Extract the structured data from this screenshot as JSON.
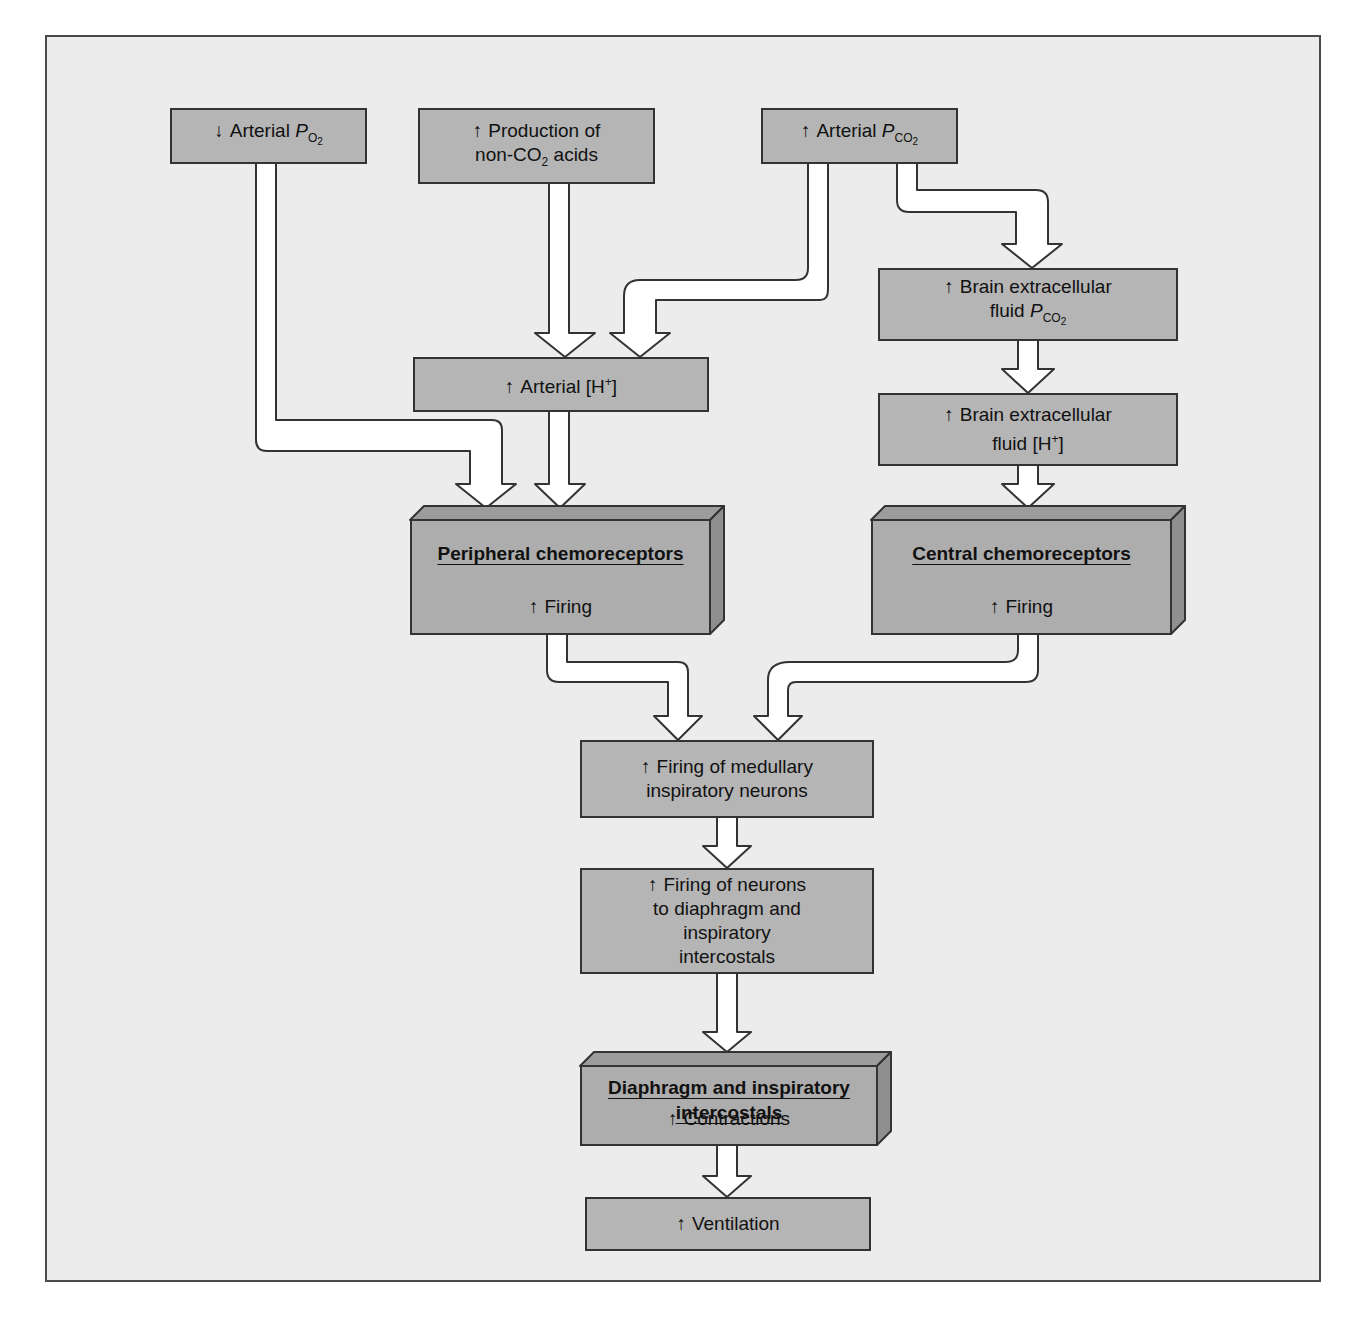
{
  "diagram": {
    "type": "flowchart",
    "colors": {
      "background": "#ffffff",
      "panel": "#ececec",
      "box_fill": "#b5b5b5",
      "box_side": "#8f8f8f",
      "box_top": "#9c9c9c",
      "border": "#333333",
      "arrow_fill": "#ffffff"
    },
    "icons": {
      "increase": "↑",
      "decrease": "↓"
    },
    "nodes": {
      "arterial_po2": {
        "direction": "↓",
        "label": "Arterial ",
        "var": "P",
        "var_sub": "O",
        "var_sub2": "2"
      },
      "non_co2_acids": {
        "direction": "↑",
        "line1": "Production of",
        "line2_pre": "non-CO",
        "line2_sub": "2",
        "line2_post": " acids"
      },
      "arterial_pco2": {
        "direction": "↑",
        "label": "Arterial ",
        "var": "P",
        "var_sub": "CO",
        "var_sub2": "2"
      },
      "brain_pco2": {
        "direction": "↑",
        "line1": "Brain extracellular",
        "line2": "fluid ",
        "var": "P",
        "var_sub": "CO",
        "var_sub2": "2"
      },
      "brain_h": {
        "direction": "↑",
        "line1": "Brain extracellular",
        "line2_pre": "fluid [H",
        "line2_sup": "+",
        "line2_post": "]"
      },
      "arterial_h": {
        "direction": "↑",
        "label_pre": "Arterial [H",
        "label_sup": "+",
        "label_post": "]"
      },
      "peripheral": {
        "title": "Peripheral chemoreceptors",
        "direction": "↑",
        "effect": "Firing"
      },
      "central": {
        "title": "Central chemoreceptors",
        "direction": "↑",
        "effect": "Firing"
      },
      "medullary": {
        "direction": "↑",
        "line1": "Firing of medullary",
        "line2": "inspiratory neurons"
      },
      "neurons_diaphragm": {
        "direction": "↑",
        "line1": "Firing of neurons",
        "line2": "to diaphragm and",
        "line3": "inspiratory",
        "line4": "intercostals"
      },
      "diaphragm": {
        "title_line1": "Diaphragm and inspiratory",
        "title_line2": "intercostals",
        "direction": "↑",
        "effect": "Contractions"
      },
      "ventilation": {
        "direction": "↑",
        "label": "Ventilation"
      }
    },
    "edges": [
      {
        "from": "arterial_po2",
        "to": "peripheral"
      },
      {
        "from": "non_co2_acids",
        "to": "arterial_h"
      },
      {
        "from": "arterial_pco2",
        "to": "arterial_h"
      },
      {
        "from": "arterial_pco2",
        "to": "brain_pco2"
      },
      {
        "from": "brain_pco2",
        "to": "brain_h"
      },
      {
        "from": "brain_h",
        "to": "central"
      },
      {
        "from": "arterial_h",
        "to": "peripheral"
      },
      {
        "from": "peripheral",
        "to": "medullary"
      },
      {
        "from": "central",
        "to": "medullary"
      },
      {
        "from": "medullary",
        "to": "neurons_diaphragm"
      },
      {
        "from": "neurons_diaphragm",
        "to": "diaphragm"
      },
      {
        "from": "diaphragm",
        "to": "ventilation"
      }
    ]
  }
}
